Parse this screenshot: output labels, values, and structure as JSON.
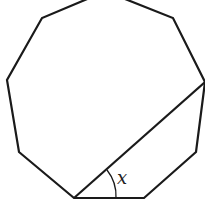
{
  "diagram": {
    "shape": "regular nonagon",
    "diagonal": "from bottom-left vertex to right vertex",
    "angle_label": "x",
    "stroke_color": "#1a1a1a"
  }
}
